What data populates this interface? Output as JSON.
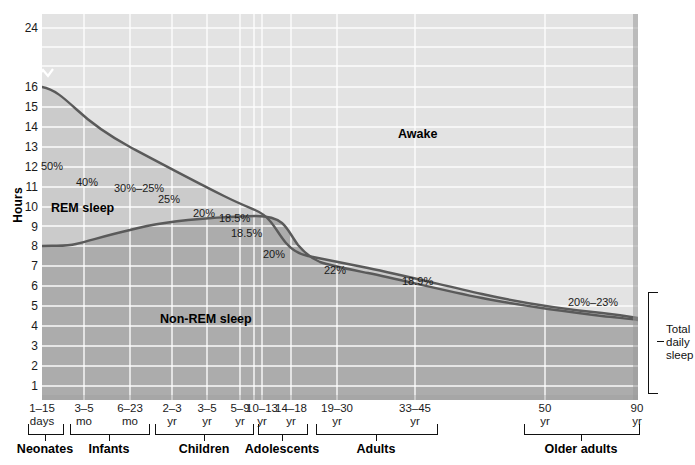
{
  "axes": {
    "ylabel": "Hours",
    "yticks": [
      {
        "v": 24,
        "y": 28
      },
      {
        "v": 16,
        "y": 87
      },
      {
        "v": 15,
        "y": 107
      },
      {
        "v": 14,
        "y": 127
      },
      {
        "v": 13,
        "y": 147
      },
      {
        "v": 12,
        "y": 167
      },
      {
        "v": 11,
        "y": 187
      },
      {
        "v": 10,
        "y": 207
      },
      {
        "v": 9,
        "y": 227
      },
      {
        "v": 8,
        "y": 246
      },
      {
        "v": 7,
        "y": 266
      },
      {
        "v": 6,
        "y": 286
      },
      {
        "v": 5,
        "y": 306
      },
      {
        "v": 4,
        "y": 326
      },
      {
        "v": 3,
        "y": 346
      },
      {
        "v": 2,
        "y": 366
      },
      {
        "v": 1,
        "y": 386
      }
    ],
    "xticks": [
      {
        "top": "1–15",
        "bottom": "days",
        "x": 42
      },
      {
        "top": "3–5",
        "bottom": "mo",
        "x": 84
      },
      {
        "top": "6–23",
        "bottom": "mo",
        "x": 130
      },
      {
        "top": "2–3",
        "bottom": "yr",
        "x": 172
      },
      {
        "top": "3–5",
        "bottom": "yr",
        "x": 207
      },
      {
        "top": "5–9",
        "bottom": "yr",
        "x": 240
      },
      {
        "top": "10–13",
        "bottom": "yr",
        "x": 262
      },
      {
        "top": "14–18",
        "bottom": "yr",
        "x": 291
      },
      {
        "top": "19–30",
        "bottom": "yr",
        "x": 337
      },
      {
        "top": "33–45",
        "bottom": "yr",
        "x": 415
      },
      {
        "top": "50",
        "bottom": "yr",
        "x": 545
      },
      {
        "top": "90",
        "bottom": "yr",
        "x": 637
      }
    ],
    "groups": [
      {
        "label": "Neonates",
        "x0": 28,
        "x1": 62,
        "tick": 45
      },
      {
        "label": "Infants",
        "x0": 70,
        "x1": 148,
        "tick": 109
      },
      {
        "label": "Children",
        "x0": 155,
        "x1": 252,
        "tick": 204
      },
      {
        "label": "Adolescents",
        "x0": 258,
        "x1": 306,
        "tick": 282
      },
      {
        "label": "Adults",
        "x0": 316,
        "x1": 436,
        "tick": 376
      },
      {
        "label": "Older adults",
        "x0": 524,
        "x1": 638,
        "tick": 581
      }
    ]
  },
  "regions": {
    "awake": "Awake",
    "rem": "REM sleep",
    "nonrem": "Non-REM sleep"
  },
  "annotations": [
    {
      "text": "50%",
      "x": 41,
      "y": 161
    },
    {
      "text": "40%",
      "x": 76,
      "y": 177
    },
    {
      "text": "30%–25%",
      "x": 114,
      "y": 183
    },
    {
      "text": "25%",
      "x": 158,
      "y": 194
    },
    {
      "text": "20%",
      "x": 193,
      "y": 208
    },
    {
      "text": "18.5%",
      "x": 219,
      "y": 213
    },
    {
      "text": "18.5%",
      "x": 231,
      "y": 228
    },
    {
      "text": "20%",
      "x": 263,
      "y": 249
    },
    {
      "text": "22%",
      "x": 324,
      "y": 265
    },
    {
      "text": "18.9%",
      "x": 402,
      "y": 276
    },
    {
      "text": "20%–23%",
      "x": 568,
      "y": 297
    }
  ],
  "right_bracket": {
    "line1": "Total",
    "line2": "daily",
    "line3": "sleep"
  },
  "colors": {
    "awake_fill": "#e3e3e3",
    "rem_fill": "#cccccc",
    "nonrem_fill": "#acacac",
    "curve": "#5a5a5a",
    "gridline": "#ffffff",
    "plot_edge": "#9a9a9a"
  },
  "chart_data": {
    "type": "area",
    "xlabel": "Age",
    "ylabel": "Hours",
    "ylim": [
      0,
      24
    ],
    "y_axis_break": {
      "between": [
        16,
        24
      ],
      "note": "axis compressed between 16 and 24 hours"
    },
    "grid": true,
    "legend": "none (regions labelled in place)",
    "categories": [
      "1–15 days",
      "3–5 mo",
      "6–23 mo",
      "2–3 yr",
      "3–5 yr",
      "5–9 yr",
      "10–13 yr",
      "14–18 yr",
      "19–30 yr",
      "33–45 yr",
      "50 yr",
      "90 yr"
    ],
    "series": [
      {
        "name": "Total daily sleep (hours)",
        "values": [
          16.0,
          14.3,
          13.2,
          12.0,
          11.2,
          10.5,
          9.9,
          8.4,
          7.8,
          7.2,
          6.5,
          5.7
        ]
      },
      {
        "name": "Non-REM sleep (hours)",
        "values": [
          8.0,
          8.6,
          9.4,
          9.0,
          8.7,
          8.5,
          8.1,
          6.8,
          6.3,
          5.9,
          5.3,
          4.3
        ]
      },
      {
        "name": "REM sleep (hours)",
        "values": [
          8.0,
          5.7,
          3.8,
          3.0,
          2.5,
          2.0,
          1.8,
          1.6,
          1.5,
          1.3,
          1.2,
          1.4
        ]
      }
    ],
    "rem_percent_of_total_sleep": [
      {
        "label": "50%",
        "age": "1–15 days"
      },
      {
        "label": "40%",
        "age": "3–5 mo"
      },
      {
        "label": "30%–25%",
        "age": "6–23 mo"
      },
      {
        "label": "25%",
        "age": "2–3 yr"
      },
      {
        "label": "20%",
        "age": "3–5 yr"
      },
      {
        "label": "18.5%",
        "age": "5–9 yr"
      },
      {
        "label": "18.5%",
        "age": "10–13 yr"
      },
      {
        "label": "20%",
        "age": "14–18 yr"
      },
      {
        "label": "22%",
        "age": "19–30 yr"
      },
      {
        "label": "18.9%",
        "age": "33–45 yr"
      },
      {
        "label": "20%–23%",
        "age": "50–90 yr"
      }
    ]
  }
}
